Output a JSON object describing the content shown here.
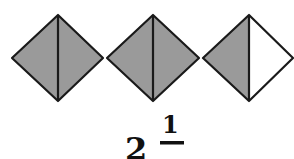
{
  "figure": {
    "shapes": [
      {
        "name": "diamond-1",
        "left_half_shaded": true,
        "right_half_shaded": true
      },
      {
        "name": "diamond-2",
        "left_half_shaded": true,
        "right_half_shaded": true
      },
      {
        "name": "diamond-3",
        "left_half_shaded": true,
        "right_half_shaded": false
      }
    ],
    "colors": {
      "shade": "#9a9a9a",
      "stroke": "#1a1a1a",
      "empty": "#ffffff"
    }
  },
  "label": {
    "whole": "2",
    "numerator": "1",
    "denominator": ""
  }
}
